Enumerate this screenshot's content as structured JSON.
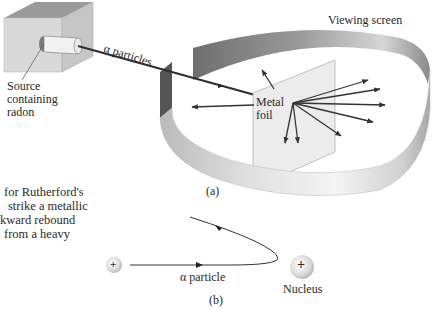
{
  "figure_a": {
    "label": "(a)",
    "labels": {
      "viewing_screen": "Viewing screen",
      "alpha_particles": "α particles",
      "source_line1": "Source",
      "source_line2": "containing",
      "source_line3": "radon",
      "metal_line1": "Metal",
      "metal_line2": "foil"
    }
  },
  "figure_b": {
    "label": "(b)",
    "alpha_particle": "α particle",
    "nucleus": "Nucleus",
    "alpha_charge": "+",
    "nucleus_charge": "+"
  },
  "caption_fragment": {
    "line1": "for Rutherford's",
    "line2": "strike a metallic",
    "line3": "kward rebound",
    "line4": "from a heavy"
  },
  "colors": {
    "screen_dark": "#707070",
    "screen_light": "#e6e6e6",
    "box_top": "#9a9a9a",
    "box_front": "#d8d8d8",
    "box_side": "#c4c4c4",
    "foil": "#ececec",
    "arrow": "#3a3a3a"
  }
}
